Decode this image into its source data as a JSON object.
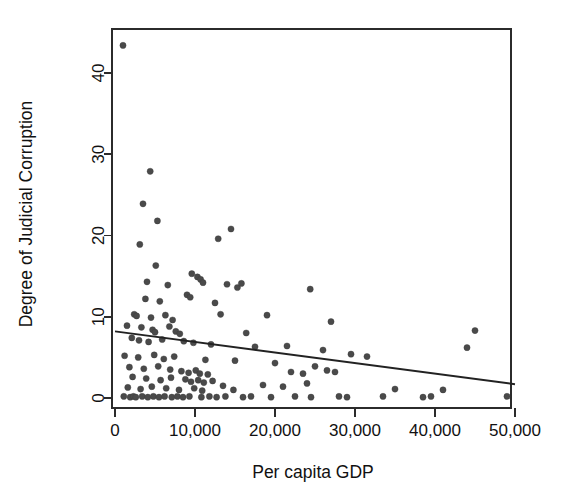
{
  "chart_data": {
    "type": "scatter",
    "title": "",
    "xlabel": "Per capita GDP",
    "ylabel": "Degree of Judicial Corruption",
    "xlim": [
      -1500,
      50500
    ],
    "ylim": [
      -1.5,
      45
    ],
    "xticks": [
      0,
      10000,
      20000,
      30000,
      40000,
      50000
    ],
    "xticklabels": [
      "0",
      "10,000",
      "20,000",
      "30,000",
      "40,000",
      "50,000"
    ],
    "yticks": [
      0,
      10,
      20,
      30,
      40
    ],
    "yticklabels": [
      "0",
      "10",
      "20",
      "30",
      "40"
    ],
    "grid": false,
    "legend": null,
    "marker_color": "#4a4a4a",
    "line_color": "#222222",
    "frame_color": "#2b2b2b",
    "trendline": {
      "label": "linear fit",
      "x0": 0,
      "y0": 8.2,
      "x1": 50000,
      "y1": 1.7
    },
    "points": [
      [
        1000,
        43.4
      ],
      [
        4400,
        27.9
      ],
      [
        3500,
        23.9
      ],
      [
        5300,
        21.8
      ],
      [
        14500,
        20.8
      ],
      [
        12900,
        19.6
      ],
      [
        3100,
        18.9
      ],
      [
        5100,
        16.3
      ],
      [
        9600,
        15.3
      ],
      [
        10300,
        14.9
      ],
      [
        10700,
        14.6
      ],
      [
        11000,
        14.2
      ],
      [
        4000,
        14.3
      ],
      [
        6600,
        13.9
      ],
      [
        14000,
        14.0
      ],
      [
        15300,
        13.6
      ],
      [
        15800,
        14.1
      ],
      [
        24400,
        13.4
      ],
      [
        3800,
        12.2
      ],
      [
        5600,
        11.9
      ],
      [
        9000,
        12.7
      ],
      [
        9400,
        12.4
      ],
      [
        12500,
        11.7
      ],
      [
        2400,
        10.3
      ],
      [
        2700,
        10.1
      ],
      [
        4500,
        9.9
      ],
      [
        6300,
        10.2
      ],
      [
        7200,
        9.6
      ],
      [
        13200,
        10.3
      ],
      [
        19000,
        10.2
      ],
      [
        27000,
        9.4
      ],
      [
        45000,
        8.3
      ],
      [
        1500,
        8.9
      ],
      [
        3300,
        8.7
      ],
      [
        4700,
        8.4
      ],
      [
        5000,
        8.1
      ],
      [
        6800,
        8.8
      ],
      [
        7600,
        8.2
      ],
      [
        8100,
        7.9
      ],
      [
        16400,
        8.0
      ],
      [
        44000,
        6.2
      ],
      [
        2100,
        7.4
      ],
      [
        3000,
        7.1
      ],
      [
        4200,
        6.9
      ],
      [
        5900,
        7.2
      ],
      [
        8600,
        7.0
      ],
      [
        9800,
        6.8
      ],
      [
        12000,
        6.6
      ],
      [
        17500,
        6.3
      ],
      [
        21500,
        6.4
      ],
      [
        26000,
        5.9
      ],
      [
        29500,
        5.4
      ],
      [
        31500,
        5.1
      ],
      [
        1200,
        5.2
      ],
      [
        2900,
        5.0
      ],
      [
        4900,
        5.3
      ],
      [
        6100,
        4.8
      ],
      [
        7400,
        5.1
      ],
      [
        11300,
        4.7
      ],
      [
        15000,
        4.6
      ],
      [
        20000,
        4.3
      ],
      [
        25000,
        3.9
      ],
      [
        1800,
        3.8
      ],
      [
        3600,
        3.6
      ],
      [
        5400,
        3.9
      ],
      [
        6900,
        3.5
      ],
      [
        8300,
        3.3
      ],
      [
        9200,
        3.1
      ],
      [
        10100,
        3.4
      ],
      [
        10600,
        3.0
      ],
      [
        11600,
        2.9
      ],
      [
        22000,
        3.2
      ],
      [
        23500,
        3.0
      ],
      [
        26500,
        3.4
      ],
      [
        27500,
        3.2
      ],
      [
        2200,
        2.6
      ],
      [
        3900,
        2.4
      ],
      [
        5700,
        2.2
      ],
      [
        7000,
        2.5
      ],
      [
        8800,
        2.3
      ],
      [
        9500,
        2.0
      ],
      [
        10400,
        2.2
      ],
      [
        11100,
        1.9
      ],
      [
        12200,
        2.1
      ],
      [
        18500,
        1.6
      ],
      [
        24000,
        1.8
      ],
      [
        1600,
        1.3
      ],
      [
        3200,
        1.1
      ],
      [
        4600,
        1.4
      ],
      [
        6400,
        1.2
      ],
      [
        8000,
        1.0
      ],
      [
        9900,
        1.2
      ],
      [
        10900,
        0.9
      ],
      [
        13500,
        1.5
      ],
      [
        14800,
        1.0
      ],
      [
        21000,
        1.4
      ],
      [
        35000,
        1.1
      ],
      [
        41000,
        1.0
      ],
      [
        1100,
        0.2
      ],
      [
        1900,
        0.1
      ],
      [
        2300,
        0.2
      ],
      [
        2600,
        0.1
      ],
      [
        3400,
        0.2
      ],
      [
        4100,
        0.1
      ],
      [
        4800,
        0.2
      ],
      [
        5500,
        0.1
      ],
      [
        6200,
        0.2
      ],
      [
        7100,
        0.1
      ],
      [
        7800,
        0.2
      ],
      [
        8500,
        0.1
      ],
      [
        9300,
        0.2
      ],
      [
        10800,
        0.1
      ],
      [
        11800,
        0.2
      ],
      [
        12700,
        0.1
      ],
      [
        13800,
        0.2
      ],
      [
        16000,
        0.1
      ],
      [
        17000,
        0.2
      ],
      [
        19500,
        0.1
      ],
      [
        22500,
        0.2
      ],
      [
        24500,
        0.1
      ],
      [
        28000,
        0.2
      ],
      [
        29000,
        0.1
      ],
      [
        33500,
        0.2
      ],
      [
        38500,
        0.1
      ],
      [
        39500,
        0.2
      ],
      [
        49000,
        0.2
      ]
    ]
  }
}
